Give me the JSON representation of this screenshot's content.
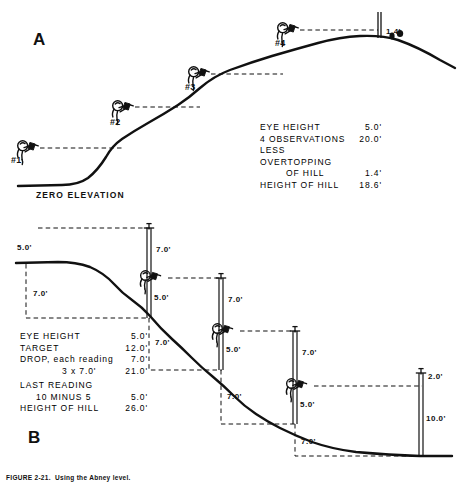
{
  "figure": {
    "caption": "FIGURE 2-21.  Using the Abney level.",
    "panels": [
      {
        "letter": "A",
        "ground_label": "ZERO ELEVATION",
        "observers": [
          {
            "id": "#1"
          },
          {
            "id": "#2"
          },
          {
            "id": "#3"
          },
          {
            "id": "#4"
          }
        ],
        "rod_label": "1.4'",
        "calc": {
          "rows": [
            {
              "label": "EYE  HEIGHT",
              "value": "5.0'"
            },
            {
              "label": "4  OBSERVATIONS",
              "value": "20.0'"
            },
            {
              "label": "LESS  OVERTOPPING",
              "value": ""
            },
            {
              "label": "OF  HILL",
              "value": "1.4'"
            },
            {
              "label": "HEIGHT  OF  HILL",
              "value": "18.6'"
            }
          ]
        }
      },
      {
        "letter": "B",
        "eye_label": "5.0'",
        "first_drop": "7.0'",
        "rods": [
          {
            "above": "7.0'",
            "below": "5.0'",
            "drop": "7.0'"
          },
          {
            "above": "7.0'",
            "below": "5.0'",
            "drop": "7.0'"
          },
          {
            "above": "7.0'",
            "below": "5.0'",
            "drop": "7.0'"
          },
          {
            "above": "2.0'",
            "below": "10.0'",
            "drop": "8.0'"
          }
        ],
        "calc": {
          "rows": [
            {
              "label": "EYE  HEIGHT",
              "value": "5.0'"
            },
            {
              "label": "TARGET",
              "value": "12.0'"
            },
            {
              "label": "DROP, each reading",
              "value": "7.0'"
            },
            {
              "label": "3 x 7.0'",
              "value": "21.0'"
            },
            {
              "label": "LAST READING",
              "value": ""
            },
            {
              "label": "10 MINUS 5",
              "value": "5.0'"
            },
            {
              "label": "HEIGHT  OF  HILL",
              "value": "26.0'"
            }
          ]
        }
      }
    ],
    "colors": {
      "ink": "#111111",
      "paper": "#ffffff"
    }
  }
}
